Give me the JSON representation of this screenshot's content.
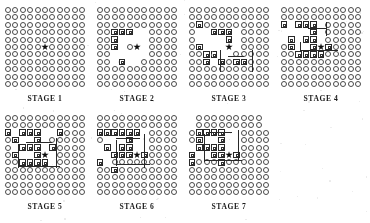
{
  "figure": {
    "title": "",
    "grid_size": 11,
    "glyphs": {
      "empty_cell": "circle-glyph",
      "marked_cell": "square-glyph",
      "center": "star-glyph"
    },
    "star_cell": [
      5,
      5
    ]
  },
  "panels": [
    {
      "id": "stage-1",
      "caption": "STAGE 1",
      "marked": [],
      "missing": [],
      "paths": []
    },
    {
      "id": "stage-2",
      "caption": "STAGE 2",
      "marked": [
        [
          2,
          3
        ],
        [
          2,
          4
        ],
        [
          2,
          5
        ],
        [
          3,
          3
        ],
        [
          4,
          3
        ],
        [
          3,
          7
        ]
      ],
      "missing": [
        [
          3,
          4
        ],
        [
          3,
          5
        ],
        [
          3,
          6
        ],
        [
          4,
          4
        ],
        [
          4,
          6
        ],
        [
          5,
          3
        ],
        [
          5,
          4
        ],
        [
          5,
          6
        ],
        [
          6,
          3
        ],
        [
          6,
          4
        ],
        [
          6,
          5
        ],
        [
          6,
          6
        ],
        [
          4,
          7
        ],
        [
          5,
          7
        ],
        [
          2,
          6
        ],
        [
          2,
          7
        ]
      ],
      "paths": []
    },
    {
      "id": "stage-3",
      "caption": "STAGE 3",
      "marked": [
        [
          1,
          2
        ],
        [
          1,
          5
        ],
        [
          2,
          6
        ],
        [
          2,
          7
        ],
        [
          3,
          3
        ],
        [
          3,
          6
        ],
        [
          4,
          3
        ],
        [
          5,
          3
        ],
        [
          5,
          4
        ],
        [
          6,
          7
        ],
        [
          7,
          7
        ],
        [
          4,
          7
        ]
      ],
      "missing": [
        [
          2,
          3
        ],
        [
          2,
          4
        ],
        [
          2,
          5
        ],
        [
          3,
          4
        ],
        [
          3,
          5
        ],
        [
          3,
          7
        ],
        [
          4,
          4
        ],
        [
          4,
          5
        ],
        [
          4,
          6
        ],
        [
          5,
          5
        ],
        [
          5,
          6
        ],
        [
          6,
          3
        ],
        [
          6,
          4
        ],
        [
          6,
          5
        ],
        [
          1,
          3
        ],
        [
          1,
          4
        ]
      ],
      "paths": [
        {
          "x": 40,
          "y": 50,
          "w": 16,
          "h": 1
        },
        {
          "x": 32,
          "y": 44,
          "w": 1,
          "h": 22
        },
        {
          "x": 64,
          "y": 44,
          "w": 1,
          "h": 22
        }
      ]
    },
    {
      "id": "stage-4",
      "caption": "STAGE 4",
      "marked": [
        [
          0,
          2
        ],
        [
          1,
          4
        ],
        [
          2,
          2
        ],
        [
          2,
          6
        ],
        [
          3,
          2
        ],
        [
          3,
          4
        ],
        [
          3,
          6
        ],
        [
          4,
          2
        ],
        [
          4,
          3
        ],
        [
          4,
          4
        ],
        [
          4,
          5
        ],
        [
          4,
          6
        ],
        [
          5,
          6
        ],
        [
          6,
          5
        ],
        [
          1,
          5
        ]
      ],
      "missing": [
        [
          1,
          2
        ],
        [
          1,
          3
        ],
        [
          2,
          3
        ],
        [
          2,
          4
        ],
        [
          2,
          5
        ],
        [
          3,
          3
        ],
        [
          3,
          5
        ],
        [
          5,
          2
        ],
        [
          5,
          3
        ],
        [
          5,
          4
        ],
        [
          5,
          5
        ],
        [
          0,
          3
        ],
        [
          0,
          4
        ]
      ],
      "paths": [
        {
          "x": 28,
          "y": 22,
          "w": 18,
          "h": 1
        },
        {
          "x": 20,
          "y": 44,
          "w": 38,
          "h": 1
        },
        {
          "x": 20,
          "y": 36,
          "w": 1,
          "h": 10
        },
        {
          "x": 46,
          "y": 16,
          "w": 1,
          "h": 14
        }
      ]
    },
    {
      "id": "stage-5",
      "caption": "STAGE 5",
      "marked": [
        [
          0,
          2
        ],
        [
          1,
          3
        ],
        [
          1,
          5
        ],
        [
          2,
          2
        ],
        [
          2,
          4
        ],
        [
          2,
          6
        ],
        [
          3,
          2
        ],
        [
          3,
          4
        ],
        [
          3,
          6
        ],
        [
          4,
          2
        ],
        [
          4,
          3
        ],
        [
          4,
          4
        ],
        [
          4,
          5
        ],
        [
          4,
          6
        ],
        [
          5,
          6
        ],
        [
          6,
          4
        ],
        [
          7,
          2
        ]
      ],
      "missing": [
        [
          1,
          2
        ],
        [
          1,
          4
        ],
        [
          2,
          3
        ],
        [
          2,
          5
        ],
        [
          3,
          3
        ],
        [
          3,
          5
        ],
        [
          5,
          2
        ],
        [
          5,
          3
        ],
        [
          5,
          4
        ],
        [
          5,
          5
        ],
        [
          6,
          2
        ],
        [
          6,
          5
        ],
        [
          6,
          6
        ]
      ],
      "paths": [
        {
          "x": 22,
          "y": 28,
          "w": 26,
          "h": 1
        },
        {
          "x": 14,
          "y": 52,
          "w": 42,
          "h": 1
        },
        {
          "x": 14,
          "y": 30,
          "w": 1,
          "h": 24
        },
        {
          "x": 52,
          "y": 24,
          "w": 1,
          "h": 30
        }
      ]
    },
    {
      "id": "stage-6",
      "caption": "STAGE 6",
      "marked": [
        [
          1,
          2
        ],
        [
          1,
          4
        ],
        [
          2,
          2
        ],
        [
          2,
          5
        ],
        [
          3,
          2
        ],
        [
          3,
          4
        ],
        [
          3,
          5
        ],
        [
          4,
          2
        ],
        [
          4,
          3
        ],
        [
          4,
          4
        ],
        [
          4,
          5
        ],
        [
          5,
          2
        ],
        [
          5,
          5
        ],
        [
          6,
          5
        ],
        [
          2,
          7
        ],
        [
          0,
          2
        ],
        [
          0,
          6
        ]
      ],
      "missing": [
        [
          0,
          4
        ],
        [
          0,
          5
        ],
        [
          1,
          3
        ],
        [
          2,
          3
        ],
        [
          2,
          4
        ],
        [
          3,
          3
        ],
        [
          5,
          3
        ],
        [
          5,
          4
        ],
        [
          6,
          2
        ],
        [
          6,
          3
        ],
        [
          6,
          4
        ],
        [
          1,
          5
        ],
        [
          1,
          6
        ]
      ],
      "paths": [
        {
          "x": 20,
          "y": 24,
          "w": 24,
          "h": 1
        },
        {
          "x": 20,
          "y": 50,
          "w": 34,
          "h": 1
        },
        {
          "x": 20,
          "y": 26,
          "w": 1,
          "h": 26
        },
        {
          "x": 48,
          "y": 20,
          "w": 1,
          "h": 34
        }
      ]
    },
    {
      "id": "stage-7",
      "caption": "STAGE 7",
      "marked": [
        [
          1,
          2
        ],
        [
          1,
          3
        ],
        [
          1,
          4
        ],
        [
          2,
          2
        ],
        [
          2,
          4
        ],
        [
          3,
          2
        ],
        [
          3,
          4
        ],
        [
          3,
          5
        ],
        [
          4,
          2
        ],
        [
          4,
          3
        ],
        [
          4,
          4
        ],
        [
          4,
          5
        ],
        [
          4,
          6
        ],
        [
          5,
          5
        ],
        [
          6,
          5
        ],
        [
          0,
          5
        ],
        [
          0,
          6
        ]
      ],
      "missing": [
        [
          0,
          0
        ],
        [
          0,
          4
        ],
        [
          1,
          5
        ],
        [
          2,
          3
        ],
        [
          2,
          5
        ],
        [
          3,
          3
        ],
        [
          5,
          2
        ],
        [
          5,
          3
        ],
        [
          5,
          4
        ],
        [
          6,
          2
        ],
        [
          6,
          3
        ],
        [
          6,
          4
        ],
        [
          0,
          1
        ],
        [
          10,
          0
        ],
        [
          10,
          1
        ]
      ],
      "paths": [
        {
          "x": 18,
          "y": 18,
          "w": 26,
          "h": 1
        },
        {
          "x": 16,
          "y": 46,
          "w": 38,
          "h": 1
        },
        {
          "x": 16,
          "y": 20,
          "w": 1,
          "h": 28
        },
        {
          "x": 50,
          "y": 16,
          "w": 1,
          "h": 30
        }
      ]
    }
  ],
  "colors": {
    "ink": "#2b2b2b",
    "circle_stroke": "#4a4a4a",
    "paper": "#ffffff"
  }
}
